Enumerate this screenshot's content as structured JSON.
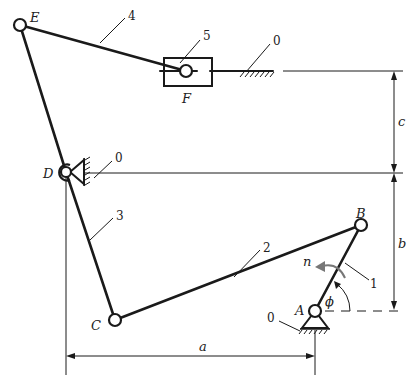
{
  "figure": {
    "points": {
      "A": "A",
      "B": "B",
      "C": "C",
      "D": "D",
      "E": "E",
      "F": "F"
    },
    "links": {
      "ground": "0",
      "crank": "1",
      "coupler_BC": "2",
      "rocker_CDE": "3",
      "link_EF": "4",
      "slider": "5"
    },
    "dimensions": {
      "a": "a",
      "b": "b",
      "c": "c"
    },
    "angle": "ϕ",
    "angular_velocity": "n",
    "caption": ""
  }
}
